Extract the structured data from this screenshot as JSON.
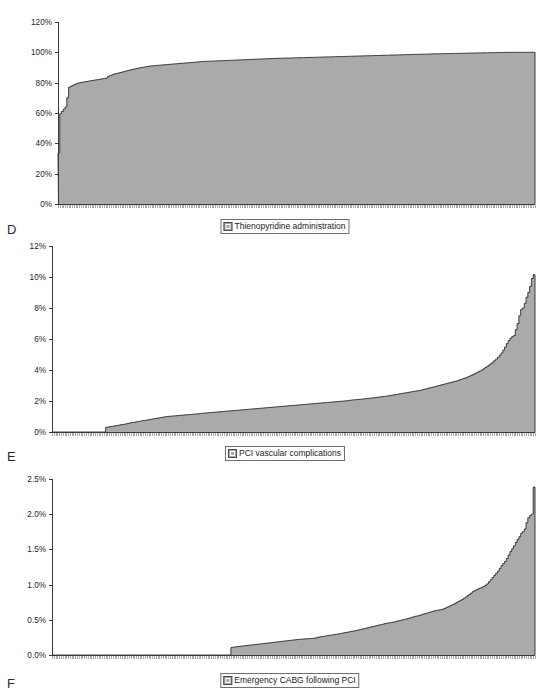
{
  "figure": {
    "background": "#ffffff",
    "series_fill": "#aaaaaa",
    "series_stroke": "#2b2b2b"
  },
  "panels": [
    {
      "letter": "D",
      "legend_label": "Thienopyridine administration",
      "legend_icon": "series-swatch-icon"
    },
    {
      "letter": "E",
      "legend_label": "PCI vascular complications",
      "legend_icon": "series-swatch-icon"
    },
    {
      "letter": "F",
      "legend_label": "Emergency CABG following PCI",
      "legend_icon": "series-swatch-icon"
    }
  ],
  "chart_data": [
    {
      "type": "area",
      "title": "",
      "xlabel": "",
      "ylabel": "",
      "legend": [
        "Thienopyridine administration"
      ],
      "legend_position": "bottom-center",
      "grid": false,
      "ylim": [
        0,
        1.2
      ],
      "yticks": [
        0,
        0.2,
        0.4,
        0.6,
        0.8,
        1.0,
        1.2
      ],
      "ytick_labels": [
        "0%",
        "20%",
        "40%",
        "60%",
        "80%",
        "100%",
        "120%"
      ],
      "x_description": "Individual hospitals ordered by increasing rate (n ≈ 270, unlabeled)",
      "n_points": 270,
      "values": [
        0.335,
        0.595,
        0.61,
        0.625,
        0.64,
        0.7,
        0.77,
        0.776,
        0.782,
        0.788,
        0.793,
        0.797,
        0.8,
        0.802,
        0.804,
        0.806,
        0.808,
        0.81,
        0.812,
        0.814,
        0.816,
        0.818,
        0.82,
        0.822,
        0.824,
        0.826,
        0.828,
        0.83,
        0.84,
        0.845,
        0.85,
        0.855,
        0.858,
        0.861,
        0.864,
        0.867,
        0.87,
        0.873,
        0.876,
        0.879,
        0.882,
        0.885,
        0.888,
        0.89,
        0.893,
        0.896,
        0.898,
        0.9,
        0.902,
        0.904,
        0.906,
        0.908,
        0.91,
        0.911,
        0.912,
        0.913,
        0.914,
        0.915,
        0.916,
        0.917,
        0.918,
        0.919,
        0.92,
        0.921,
        0.922,
        0.923,
        0.924,
        0.925,
        0.926,
        0.927,
        0.928,
        0.929,
        0.93,
        0.931,
        0.932,
        0.933,
        0.934,
        0.935,
        0.936,
        0.937,
        0.938,
        0.939,
        0.94,
        0.94,
        0.941,
        0.941,
        0.942,
        0.942,
        0.943,
        0.943,
        0.944,
        0.944,
        0.945,
        0.945,
        0.946,
        0.946,
        0.947,
        0.947,
        0.948,
        0.948,
        0.949,
        0.949,
        0.95,
        0.95,
        0.951,
        0.951,
        0.952,
        0.952,
        0.953,
        0.953,
        0.954,
        0.954,
        0.955,
        0.955,
        0.956,
        0.956,
        0.957,
        0.957,
        0.958,
        0.958,
        0.959,
        0.959,
        0.96,
        0.96,
        0.96,
        0.961,
        0.961,
        0.961,
        0.962,
        0.962,
        0.962,
        0.963,
        0.963,
        0.963,
        0.964,
        0.964,
        0.964,
        0.965,
        0.965,
        0.965,
        0.966,
        0.966,
        0.966,
        0.967,
        0.967,
        0.967,
        0.968,
        0.968,
        0.968,
        0.969,
        0.969,
        0.969,
        0.97,
        0.97,
        0.97,
        0.971,
        0.971,
        0.971,
        0.972,
        0.972,
        0.972,
        0.973,
        0.973,
        0.973,
        0.974,
        0.974,
        0.974,
        0.975,
        0.975,
        0.975,
        0.976,
        0.976,
        0.976,
        0.977,
        0.977,
        0.977,
        0.978,
        0.978,
        0.978,
        0.979,
        0.979,
        0.979,
        0.98,
        0.98,
        0.98,
        0.981,
        0.981,
        0.981,
        0.982,
        0.982,
        0.982,
        0.983,
        0.983,
        0.983,
        0.984,
        0.984,
        0.984,
        0.985,
        0.985,
        0.985,
        0.986,
        0.986,
        0.986,
        0.987,
        0.987,
        0.987,
        0.988,
        0.988,
        0.988,
        0.989,
        0.989,
        0.989,
        0.99,
        0.99,
        0.99,
        0.99,
        0.991,
        0.991,
        0.991,
        0.991,
        0.992,
        0.992,
        0.992,
        0.992,
        0.993,
        0.993,
        0.993,
        0.993,
        0.994,
        0.994,
        0.994,
        0.994,
        0.995,
        0.995,
        0.995,
        0.995,
        0.996,
        0.996,
        0.996,
        0.996,
        0.997,
        0.997,
        0.997,
        0.997,
        0.998,
        0.998,
        0.998,
        0.998,
        0.999,
        0.999,
        0.999,
        0.999,
        0.999,
        1.0,
        1.0,
        1.0,
        1.0,
        1.0,
        1.0,
        1.0,
        1.0,
        1.0,
        1.0,
        1.0,
        1.0,
        1.0,
        1.0,
        1.0,
        1.0,
        1.0
      ]
    },
    {
      "type": "area",
      "title": "",
      "xlabel": "",
      "ylabel": "",
      "legend": [
        "PCI vascular complications"
      ],
      "legend_position": "bottom-center",
      "grid": false,
      "ylim": [
        0,
        0.12
      ],
      "yticks": [
        0,
        0.02,
        0.04,
        0.06,
        0.08,
        0.1,
        0.12
      ],
      "ytick_labels": [
        "0%",
        "2%",
        "4%",
        "6%",
        "8%",
        "10%",
        "12%"
      ],
      "x_description": "Individual hospitals ordered by increasing rate (n ≈ 270, unlabeled)",
      "n_points": 270,
      "values": [
        0.0,
        0.0,
        0.0,
        0.0,
        0.0,
        0.0,
        0.0,
        0.0,
        0.0,
        0.0,
        0.0,
        0.0,
        0.0,
        0.0,
        0.0,
        0.0,
        0.0,
        0.0,
        0.0,
        0.0,
        0.0,
        0.0,
        0.0,
        0.0,
        0.0,
        0.0,
        0.0,
        0.0,
        0.0,
        0.0,
        0.003,
        0.0032,
        0.0034,
        0.0036,
        0.0038,
        0.004,
        0.0042,
        0.0044,
        0.0046,
        0.0048,
        0.005,
        0.0052,
        0.0055,
        0.0058,
        0.006,
        0.0062,
        0.0064,
        0.0066,
        0.0068,
        0.007,
        0.0072,
        0.0074,
        0.0076,
        0.0078,
        0.008,
        0.0082,
        0.0084,
        0.0086,
        0.0088,
        0.009,
        0.0092,
        0.0094,
        0.0096,
        0.0098,
        0.01,
        0.0101,
        0.0102,
        0.0103,
        0.0104,
        0.0105,
        0.0106,
        0.0107,
        0.0108,
        0.0109,
        0.011,
        0.0111,
        0.0112,
        0.0113,
        0.0114,
        0.0115,
        0.0116,
        0.0117,
        0.0118,
        0.012,
        0.0121,
        0.0122,
        0.0123,
        0.0124,
        0.0125,
        0.0126,
        0.0127,
        0.0128,
        0.0129,
        0.013,
        0.0131,
        0.0132,
        0.0133,
        0.0134,
        0.0135,
        0.0136,
        0.0137,
        0.0138,
        0.0139,
        0.014,
        0.0141,
        0.0142,
        0.0143,
        0.0144,
        0.0145,
        0.0146,
        0.0147,
        0.0148,
        0.0149,
        0.015,
        0.0151,
        0.0152,
        0.0153,
        0.0154,
        0.0155,
        0.0156,
        0.0157,
        0.0158,
        0.0159,
        0.016,
        0.0161,
        0.0162,
        0.0163,
        0.0164,
        0.0165,
        0.0166,
        0.0167,
        0.0168,
        0.0169,
        0.017,
        0.0171,
        0.0172,
        0.0173,
        0.0174,
        0.0175,
        0.0176,
        0.0177,
        0.0178,
        0.0179,
        0.018,
        0.0181,
        0.0182,
        0.0183,
        0.0184,
        0.0185,
        0.0186,
        0.0187,
        0.0188,
        0.0189,
        0.019,
        0.0191,
        0.0192,
        0.0193,
        0.0194,
        0.0195,
        0.0196,
        0.0197,
        0.0198,
        0.0199,
        0.02,
        0.0201,
        0.0202,
        0.0204,
        0.0206,
        0.0207,
        0.0208,
        0.0209,
        0.021,
        0.0211,
        0.0212,
        0.0214,
        0.0215,
        0.0216,
        0.0218,
        0.0219,
        0.022,
        0.0222,
        0.0223,
        0.0225,
        0.0226,
        0.0228,
        0.0229,
        0.0231,
        0.0232,
        0.0234,
        0.0236,
        0.0238,
        0.024,
        0.0242,
        0.0244,
        0.0246,
        0.0248,
        0.025,
        0.0252,
        0.0254,
        0.0256,
        0.0258,
        0.026,
        0.0262,
        0.0264,
        0.0266,
        0.0268,
        0.027,
        0.0273,
        0.0276,
        0.0279,
        0.0282,
        0.0285,
        0.0288,
        0.0291,
        0.0294,
        0.0297,
        0.03,
        0.0303,
        0.0306,
        0.0309,
        0.0312,
        0.0315,
        0.0318,
        0.0321,
        0.0324,
        0.0327,
        0.033,
        0.0334,
        0.0338,
        0.0342,
        0.0346,
        0.035,
        0.0355,
        0.036,
        0.0365,
        0.037,
        0.0376,
        0.0382,
        0.0388,
        0.0394,
        0.04,
        0.0408,
        0.0416,
        0.0424,
        0.0432,
        0.044,
        0.045,
        0.046,
        0.047,
        0.0482,
        0.0495,
        0.051,
        0.0528,
        0.0548,
        0.057,
        0.059,
        0.0605,
        0.0615,
        0.0622,
        0.066,
        0.07,
        0.075,
        0.079,
        0.08,
        0.083,
        0.087,
        0.09,
        0.094,
        0.099,
        0.1015
      ]
    },
    {
      "type": "area",
      "title": "",
      "xlabel": "",
      "ylabel": "",
      "legend": [
        "Emergency CABG following PCI"
      ],
      "legend_position": "bottom-center",
      "grid": false,
      "ylim": [
        0,
        0.025
      ],
      "yticks": [
        0,
        0.005,
        0.01,
        0.015,
        0.02,
        0.025
      ],
      "ytick_labels": [
        "0.0%",
        "0.5%",
        "1.0%",
        "1.5%",
        "2.0%",
        "2.5%"
      ],
      "x_description": "Individual hospitals ordered by increasing rate (n ≈ 270, unlabeled)",
      "n_points": 270,
      "values": [
        0.0,
        0.0,
        0.0,
        0.0,
        0.0,
        0.0,
        0.0,
        0.0,
        0.0,
        0.0,
        0.0,
        0.0,
        0.0,
        0.0,
        0.0,
        0.0,
        0.0,
        0.0,
        0.0,
        0.0,
        0.0,
        0.0,
        0.0,
        0.0,
        0.0,
        0.0,
        0.0,
        0.0,
        0.0,
        0.0,
        0.0,
        0.0,
        0.0,
        0.0,
        0.0,
        0.0,
        0.0,
        0.0,
        0.0,
        0.0,
        0.0,
        0.0,
        0.0,
        0.0,
        0.0,
        0.0,
        0.0,
        0.0,
        0.0,
        0.0,
        0.0,
        0.0,
        0.0,
        0.0,
        0.0,
        0.0,
        0.0,
        0.0,
        0.0,
        0.0,
        0.0,
        0.0,
        0.0,
        0.0,
        0.0,
        0.0,
        0.0,
        0.0,
        0.0,
        0.0,
        0.0,
        0.0,
        0.0,
        0.0,
        0.0,
        0.0,
        0.0,
        0.0,
        0.0,
        0.0,
        0.0,
        0.0,
        0.0,
        0.0,
        0.0,
        0.0,
        0.0,
        0.0,
        0.0,
        0.0,
        0.0,
        0.0,
        0.0,
        0.0,
        0.0,
        0.0,
        0.0,
        0.0,
        0.0,
        0.0,
        0.00105,
        0.0011,
        0.00115,
        0.00118,
        0.00121,
        0.00124,
        0.00127,
        0.0013,
        0.00133,
        0.00136,
        0.00139,
        0.00142,
        0.00145,
        0.00148,
        0.00151,
        0.00154,
        0.00157,
        0.0016,
        0.00163,
        0.00166,
        0.00169,
        0.00172,
        0.00175,
        0.00178,
        0.00181,
        0.00184,
        0.00187,
        0.0019,
        0.00193,
        0.00196,
        0.00199,
        0.00202,
        0.00205,
        0.00208,
        0.00211,
        0.00214,
        0.00217,
        0.0022,
        0.00222,
        0.00224,
        0.00226,
        0.00228,
        0.0023,
        0.00232,
        0.00234,
        0.00236,
        0.00238,
        0.0024,
        0.0025,
        0.00255,
        0.0026,
        0.00264,
        0.00268,
        0.00272,
        0.00276,
        0.0028,
        0.00284,
        0.00288,
        0.00292,
        0.00296,
        0.003,
        0.00305,
        0.0031,
        0.00315,
        0.0032,
        0.00325,
        0.0033,
        0.00335,
        0.0034,
        0.00345,
        0.0035,
        0.00356,
        0.00362,
        0.00368,
        0.00374,
        0.0038,
        0.00386,
        0.00392,
        0.00398,
        0.00404,
        0.0041,
        0.00416,
        0.00422,
        0.00428,
        0.00434,
        0.0044,
        0.00448,
        0.00452,
        0.00456,
        0.0046,
        0.00465,
        0.0047,
        0.00478,
        0.00484,
        0.0049,
        0.00496,
        0.00502,
        0.00508,
        0.00514,
        0.0052,
        0.00528,
        0.00536,
        0.00544,
        0.0055,
        0.00556,
        0.00562,
        0.0057,
        0.00578,
        0.00586,
        0.00594,
        0.006,
        0.00608,
        0.00616,
        0.00624,
        0.0063,
        0.00636,
        0.0064,
        0.00645,
        0.0065,
        0.0066,
        0.00672,
        0.00684,
        0.00696,
        0.00708,
        0.0072,
        0.00734,
        0.00748,
        0.00762,
        0.00776,
        0.0079,
        0.00806,
        0.00824,
        0.00842,
        0.0086,
        0.0088,
        0.009,
        0.00915,
        0.00928,
        0.0094,
        0.0095,
        0.0096,
        0.00975,
        0.0099,
        0.0101,
        0.0104,
        0.0107,
        0.011,
        0.0113,
        0.0116,
        0.0119,
        0.0123,
        0.0127,
        0.013,
        0.0133,
        0.0137,
        0.0142,
        0.0147,
        0.0151,
        0.0155,
        0.016,
        0.0164,
        0.0168,
        0.0173,
        0.0175,
        0.0179,
        0.0188,
        0.0195,
        0.0198,
        0.02,
        0.02385
      ]
    }
  ]
}
